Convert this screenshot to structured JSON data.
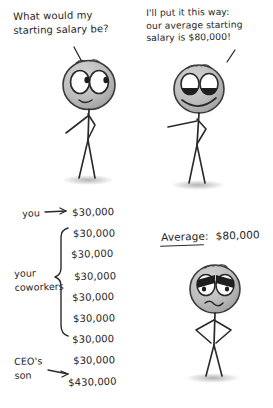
{
  "comic": {
    "title_alt": "Average salary stick figure comic",
    "background_color": "#ffffff",
    "ink_color": "#2a2a2a",
    "head_fill": "#b9b9b9"
  },
  "panel_one": {
    "speech": "What would my\nstarting salary be?",
    "character": {
      "name": "job-applicant",
      "expression": "curious-wide-eyes-small-smile"
    }
  },
  "panel_two": {
    "speech": "I'll put it this way:\nour average starting\nsalary is $80,000!",
    "character": {
      "name": "employer",
      "expression": "smug-half-lidded-grin"
    }
  },
  "panel_three": {
    "labels": {
      "you": "you",
      "coworkers": "your\ncoworkers",
      "ceo_son": "CEO's\nson"
    },
    "salaries": [
      {
        "who": "you",
        "amount": "$30,000"
      },
      {
        "who": "coworker",
        "amount": "$30,000"
      },
      {
        "who": "coworker",
        "amount": "$30,000"
      },
      {
        "who": "coworker",
        "amount": "$30,000"
      },
      {
        "who": "coworker",
        "amount": "$30,000"
      },
      {
        "who": "coworker",
        "amount": "$30,000"
      },
      {
        "who": "coworker",
        "amount": "$30,000"
      },
      {
        "who": "coworker",
        "amount": "$30,000"
      },
      {
        "who": "ceo-son",
        "amount": "$430,000"
      }
    ]
  },
  "panel_four": {
    "average_label": "Average:",
    "average_value": "$80,000",
    "character": {
      "name": "disgruntled-employee",
      "expression": "angry-furrowed-brow-frown"
    }
  }
}
